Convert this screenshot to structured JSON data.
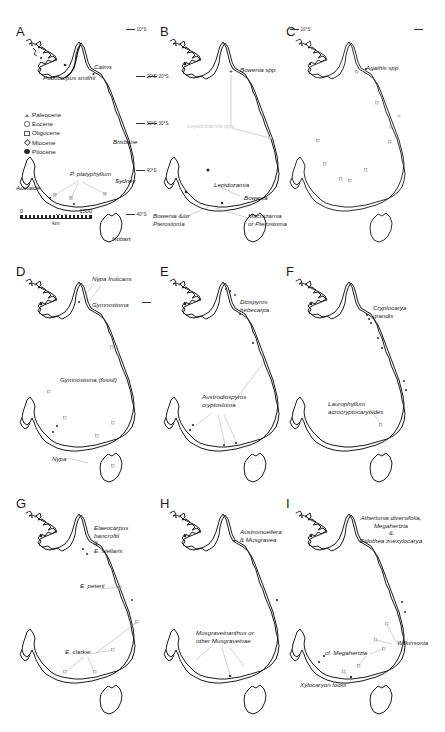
{
  "figure": {
    "panel_count": 9
  },
  "legend": {
    "items": [
      {
        "symbol": "triangle-open",
        "label": "Paleocene"
      },
      {
        "symbol": "circle-open",
        "label": "Eocene"
      },
      {
        "symbol": "square-open",
        "label": "Oligocene"
      },
      {
        "symbol": "diamond-open",
        "label": "Miocene"
      },
      {
        "symbol": "circle-filled",
        "label": "Pliocene"
      }
    ]
  },
  "scalebar": {
    "min": "0",
    "max": "1500",
    "unit": "km"
  },
  "latitude_ticks": [
    {
      "label": "10°S"
    },
    {
      "label": "20°S"
    },
    {
      "label": "30°S"
    },
    {
      "label": "40°S"
    }
  ],
  "cities": [
    {
      "name": "Cairns"
    },
    {
      "name": "Brisbane"
    },
    {
      "name": "Sydney"
    },
    {
      "name": "Adelaide"
    },
    {
      "name": "Melbourne"
    },
    {
      "name": "Hobart"
    }
  ],
  "panels": [
    {
      "id": "A",
      "letter": "A",
      "annotations": [
        {
          "text": "Podocarpus smithii"
        },
        {
          "text": "P. platyphyllum"
        }
      ]
    },
    {
      "id": "B",
      "letter": "B",
      "annotations": [
        {
          "text": "Bowenia spp."
        },
        {
          "text": "Lepidozamia spp.",
          "faint": true
        },
        {
          "text": "Lepidozamia"
        },
        {
          "text": "Bowenia"
        },
        {
          "text": "Bowenia &/or\nPterostoma"
        },
        {
          "text": "Macrozamia\nor Pterostoma"
        }
      ]
    },
    {
      "id": "C",
      "letter": "C",
      "annotations": [
        {
          "text": "Agathis spp."
        }
      ]
    },
    {
      "id": "D",
      "letter": "D",
      "annotations": [
        {
          "text": "Nypa fruticans"
        },
        {
          "text": "Gymnostoma"
        },
        {
          "text": "Gymnostoma (fossil)"
        },
        {
          "text": "Nypa"
        }
      ]
    },
    {
      "id": "E",
      "letter": "E",
      "annotations": [
        {
          "text": "Diospyros\nhebecarpa"
        },
        {
          "text": "Austrodiospyros\ncryptostoma"
        }
      ]
    },
    {
      "id": "F",
      "letter": "F",
      "annotations": [
        {
          "text": "Cryptocarya\ngrandis"
        },
        {
          "text": "Laurophyllum\nacrocryptocaryoides"
        }
      ]
    },
    {
      "id": "G",
      "letter": "G",
      "annotations": [
        {
          "text": "Elaeocarpus\nbancroftii\n&\nE. stellaris"
        },
        {
          "text": "E. peterii"
        },
        {
          "text": "E. clarkei"
        }
      ]
    },
    {
      "id": "H",
      "letter": "H",
      "annotations": [
        {
          "text": "Austromuellera\n& Musgravea"
        },
        {
          "text": "Musgraveinanthus or\nother Musgraveinae"
        }
      ]
    },
    {
      "id": "I",
      "letter": "I",
      "annotations": [
        {
          "text": "Athertonia diversifolia,\nMegahertzia\n&\nEidothea zoexylocarya"
        },
        {
          "text": "Wilkinsonia"
        },
        {
          "text": "cf. Megahertzia"
        },
        {
          "text": "Xylocaryon lockii"
        }
      ]
    }
  ],
  "colors": {
    "coastline": "#1a1a1a",
    "text": "#1b1b1b",
    "faint_text": "#c9c9c9",
    "leader": "#9a9a9a",
    "background": "#ffffff"
  }
}
